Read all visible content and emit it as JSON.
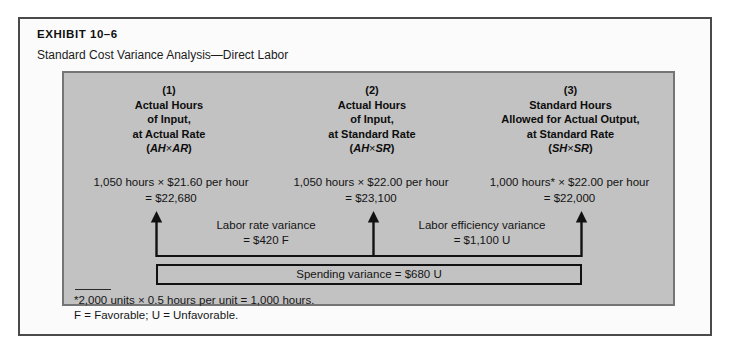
{
  "exhibit": {
    "label": "EXHIBIT 10–6",
    "subtitle": "Standard Cost Variance Analysis—Direct Labor"
  },
  "colors": {
    "panel_background": "#c2c2c2",
    "panel_border": "#757575",
    "frame_border": "#4a4a4a",
    "page_background": "#ffffff",
    "line": "#111111",
    "text": "#141414"
  },
  "columns": [
    {
      "number": "(1)",
      "line1": "Actual Hours",
      "line2": "of Input,",
      "line3": "at Actual Rate",
      "abbr_open": "(",
      "abbr_left": "AH",
      "abbr_times": "×",
      "abbr_right": "AR",
      "abbr_close": ")",
      "calc_line1_qty": "1,050 hours",
      "calc_line1_times": "×",
      "calc_line1_rate": "$21.60 per hour",
      "calc_line2": "= $22,680"
    },
    {
      "number": "(2)",
      "line1": "Actual Hours",
      "line2": "of Input,",
      "line3": "at Standard Rate",
      "abbr_open": "(",
      "abbr_left": "AH",
      "abbr_times": "×",
      "abbr_right": "SR",
      "abbr_close": ")",
      "calc_line1_qty": "1,050 hours",
      "calc_line1_times": "×",
      "calc_line1_rate": "$22.00 per hour",
      "calc_line2": "= $23,100"
    },
    {
      "number": "(3)",
      "line1": "Standard Hours",
      "line2": "Allowed for Actual Output,",
      "line3": "at Standard Rate",
      "abbr_open": "(",
      "abbr_left": "SH",
      "abbr_times": "×",
      "abbr_right": "SR",
      "abbr_close": ")",
      "calc_line1_qty": "1,000 hours*",
      "calc_line1_times": "×",
      "calc_line1_rate": "$22.00 per hour",
      "calc_line2": "= $22,000"
    }
  ],
  "variances": {
    "rate": {
      "name": "Labor rate variance",
      "amount": "= $420 F"
    },
    "efficiency": {
      "name": "Labor efficiency variance",
      "amount": "= $1,100 U"
    },
    "spending": {
      "text": "Spending variance = $680 U"
    }
  },
  "footnotes": [
    "*2,000 units × 0.5 hours per unit = 1,000 hours.",
    "F = Favorable; U = Unfavorable."
  ],
  "icons": {
    "arrow_up": "arrow-up-icon"
  }
}
